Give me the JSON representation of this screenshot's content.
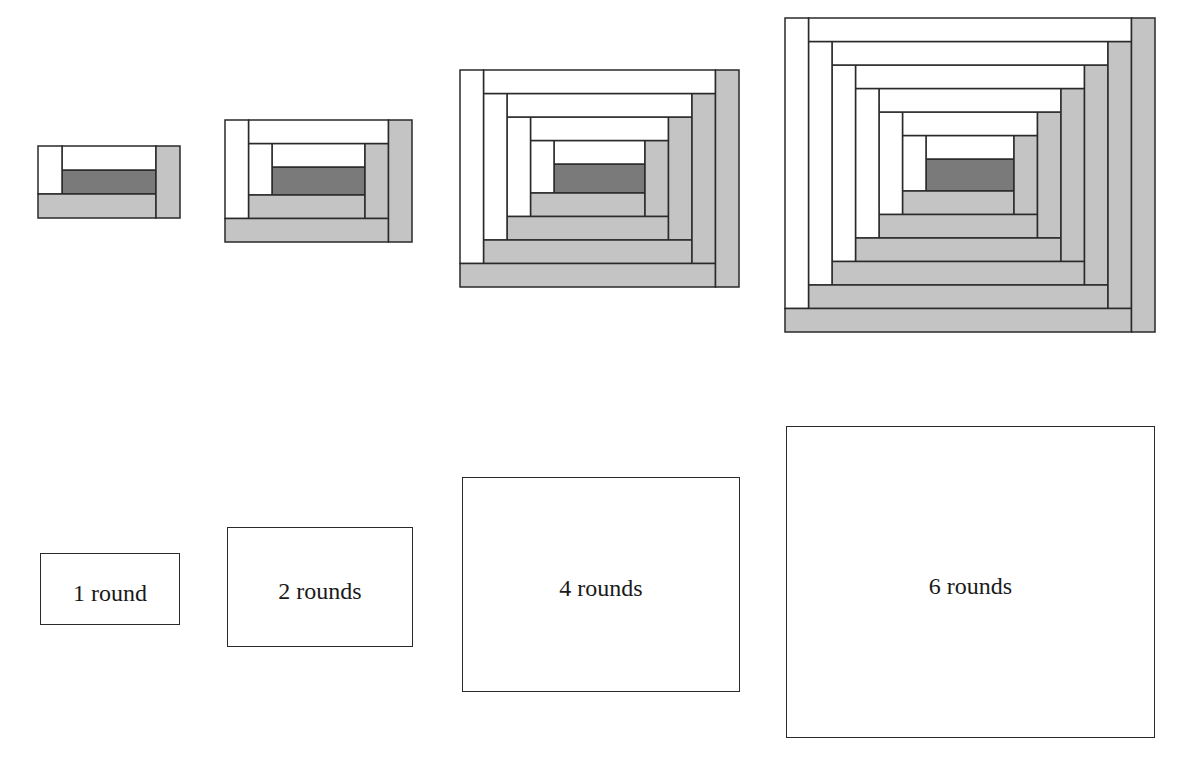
{
  "figure": {
    "colors": {
      "center": "#7a7a7a",
      "light_strip": "#ffffff",
      "dark_strip": "#c4c4c4",
      "stroke": "#2a2a2a",
      "background": "#ffffff"
    },
    "diagrams": [
      {
        "rounds": 1,
        "x": 38,
        "y": 146,
        "width": 142,
        "height": 72,
        "strip": 24,
        "center": {
          "w": 94,
          "h": 24
        }
      },
      {
        "rounds": 2,
        "x": 225,
        "y": 120,
        "width": 187,
        "height": 122,
        "strip": 23.5,
        "center": {
          "w": 93,
          "h": 24
        }
      },
      {
        "rounds": 4,
        "x": 460,
        "y": 70,
        "width": 279,
        "height": 217,
        "strip": 23.5,
        "center": {
          "w": 92,
          "h": 24
        }
      },
      {
        "rounds": 6,
        "x": 785,
        "y": 18,
        "width": 370,
        "height": 314,
        "strip": 23.5,
        "center": {
          "w": 93,
          "h": 24
        }
      }
    ],
    "labels": [
      {
        "text": "1 round",
        "x": 40,
        "y": 553,
        "width": 140,
        "height": 72
      },
      {
        "text": "2 rounds",
        "x": 227,
        "y": 527,
        "width": 186,
        "height": 120
      },
      {
        "text": "4 rounds",
        "x": 462,
        "y": 477,
        "width": 278,
        "height": 215
      },
      {
        "text": "6 rounds",
        "x": 786,
        "y": 426,
        "width": 369,
        "height": 312
      }
    ]
  }
}
